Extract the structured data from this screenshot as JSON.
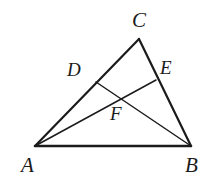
{
  "figure": {
    "background_color": "#ffffff",
    "stroke_color": "#1b1b1b",
    "label_color": "#1b1b1b",
    "width": 209,
    "height": 185
  },
  "points": {
    "A": {
      "label": "A",
      "x": 35,
      "y": 146,
      "label_x": 21,
      "label_y": 155
    },
    "B": {
      "label": "B",
      "x": 191,
      "y": 146,
      "label_x": 185,
      "label_y": 155
    },
    "C": {
      "label": "C",
      "x": 139,
      "y": 39,
      "label_x": 132,
      "label_y": 10
    },
    "D": {
      "label": "D",
      "x": 96,
      "y": 82,
      "label_x": 67,
      "label_y": 60
    },
    "E": {
      "label": "E",
      "x": 156,
      "y": 80,
      "label_x": 160,
      "label_y": 58
    },
    "F": {
      "label": "F",
      "x": 119,
      "y": 95,
      "label_x": 110,
      "label_y": 104
    }
  },
  "segments": [
    {
      "name": "side-AB",
      "from": "A",
      "to": "B",
      "width": 2.6
    },
    {
      "name": "side-AC",
      "from": "A",
      "to": "C",
      "width": 2.2
    },
    {
      "name": "side-CB",
      "from": "C",
      "to": "B",
      "width": 2.2
    },
    {
      "name": "cevian-DB",
      "from": "D",
      "to": "B",
      "width": 1.5
    },
    {
      "name": "cevian-AE",
      "from": "A",
      "to": "E",
      "width": 1.5
    }
  ]
}
